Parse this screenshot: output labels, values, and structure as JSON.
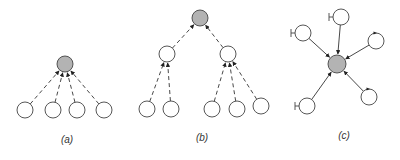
{
  "colors": {
    "edge": "#333333",
    "node_stroke": "#444444",
    "node_fill": "#ffffff",
    "center_fill": "#b3b3b3",
    "background": "#ffffff"
  },
  "panels": [
    {
      "id": "a",
      "label": "(a)",
      "label_pos": [
        67,
        143
      ],
      "edge_style": "dashed",
      "nodes": [
        {
          "id": "a0",
          "x": 65,
          "y": 64,
          "r": 8,
          "center": true
        },
        {
          "id": "a1",
          "x": 25,
          "y": 110,
          "r": 8
        },
        {
          "id": "a2",
          "x": 53,
          "y": 110,
          "r": 8
        },
        {
          "id": "a3",
          "x": 77,
          "y": 110,
          "r": 8
        },
        {
          "id": "a4",
          "x": 104,
          "y": 110,
          "r": 8
        }
      ],
      "edges": [
        {
          "from": "a1",
          "to": "a0"
        },
        {
          "from": "a2",
          "to": "a0"
        },
        {
          "from": "a3",
          "to": "a0"
        },
        {
          "from": "a4",
          "to": "a0"
        }
      ]
    },
    {
      "id": "b",
      "label": "(b)",
      "label_pos": [
        202,
        141
      ],
      "edge_style": "dashed",
      "nodes": [
        {
          "id": "b0",
          "x": 200,
          "y": 18,
          "r": 8,
          "center": true
        },
        {
          "id": "b1",
          "x": 167,
          "y": 54,
          "r": 8
        },
        {
          "id": "b2",
          "x": 228,
          "y": 54,
          "r": 8
        },
        {
          "id": "b3",
          "x": 147,
          "y": 109,
          "r": 8
        },
        {
          "id": "b4",
          "x": 171,
          "y": 109,
          "r": 8
        },
        {
          "id": "b5",
          "x": 212,
          "y": 109,
          "r": 8
        },
        {
          "id": "b6",
          "x": 237,
          "y": 109,
          "r": 8
        },
        {
          "id": "b7",
          "x": 261,
          "y": 106,
          "r": 8
        }
      ],
      "edges": [
        {
          "from": "b1",
          "to": "b0"
        },
        {
          "from": "b2",
          "to": "b0"
        },
        {
          "from": "b3",
          "to": "b1"
        },
        {
          "from": "b4",
          "to": "b1"
        },
        {
          "from": "b5",
          "to": "b2"
        },
        {
          "from": "b6",
          "to": "b2"
        },
        {
          "from": "b7",
          "to": "b2"
        }
      ]
    },
    {
      "id": "c",
      "label": "(c)",
      "label_pos": [
        344,
        139
      ],
      "edge_style": "solid",
      "nodes": [
        {
          "id": "c0",
          "x": 337,
          "y": 64,
          "r": 9,
          "center": true
        },
        {
          "id": "c1",
          "x": 341,
          "y": 17,
          "r": 8,
          "marker": "bar-left"
        },
        {
          "id": "c2",
          "x": 303,
          "y": 33,
          "r": 8,
          "marker": "bar-left"
        },
        {
          "id": "c3",
          "x": 376,
          "y": 41,
          "r": 8,
          "marker": "loop-top"
        },
        {
          "id": "c4",
          "x": 307,
          "y": 106,
          "r": 8,
          "marker": "bar-left"
        },
        {
          "id": "c5",
          "x": 369,
          "y": 97,
          "r": 8,
          "marker": "loop-top"
        }
      ],
      "edges": [
        {
          "from": "c1",
          "to": "c0"
        },
        {
          "from": "c2",
          "to": "c0"
        },
        {
          "from": "c3",
          "to": "c0"
        },
        {
          "from": "c4",
          "to": "c0"
        },
        {
          "from": "c5",
          "to": "c0"
        }
      ]
    }
  ]
}
